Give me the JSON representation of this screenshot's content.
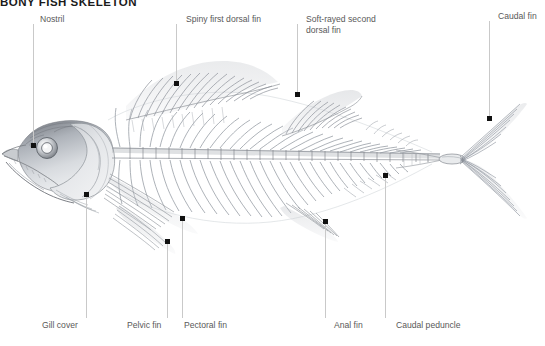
{
  "document": {
    "title": "BONY FISH SKELETON",
    "subject": "fish-skeleton-anatomical-diagram"
  },
  "palette": {
    "background": "#ffffff",
    "leader_line": "#c9c9c9",
    "leader_dot": "#111111",
    "label_text": "#595959",
    "title_text": "#1b1b1b",
    "ink_dark": "#5b5f66",
    "ink_mid": "#9aa0a8",
    "ink_light": "#c8ccd2"
  },
  "illustration": {
    "name": "tuna-skeleton-pencil-drawing",
    "description": "Grayscale pencil rendering of a bony fish (tuna) skeleton in left lateral view, showing skull, gill cover, vertebral column, ribs, dorsal fins, pectoral fin, pelvic fin, anal fin, caudal peduncle and forked caudal fin."
  },
  "callouts": [
    {
      "id": "nostril",
      "label": "Nostril",
      "side": "top",
      "label_x": 40,
      "label_y": 14,
      "line_x": 33,
      "line_top": 24,
      "line_bottom": 145,
      "dot_x": 33,
      "dot_y": 145
    },
    {
      "id": "spiny-first-dorsal-fin",
      "label": "Spiny first dorsal fin",
      "side": "top",
      "label_x": 186,
      "label_y": 14,
      "line_x": 176,
      "line_top": 24,
      "line_bottom": 83,
      "dot_x": 176,
      "dot_y": 83
    },
    {
      "id": "soft-rayed-second-dorsal-fin",
      "label": "Soft-rayed second\ndorsal fin",
      "side": "top",
      "label_x": 306,
      "label_y": 14,
      "line_x": 297,
      "line_top": 24,
      "line_bottom": 94,
      "dot_x": 297,
      "dot_y": 94
    },
    {
      "id": "caudal-fin",
      "label": "Caudal fin",
      "side": "top",
      "label_x": 498,
      "label_y": 11,
      "line_x": 489,
      "line_top": 21,
      "line_bottom": 118,
      "dot_x": 489,
      "dot_y": 118
    },
    {
      "id": "gill-cover",
      "label": "Gill cover",
      "side": "bottom",
      "label_x": 42,
      "label_y": 320,
      "line_x": 86,
      "line_top": 194,
      "line_bottom": 318,
      "dot_x": 86,
      "dot_y": 194
    },
    {
      "id": "pelvic-fin",
      "label": "Pelvic fin",
      "side": "bottom",
      "label_x": 127,
      "label_y": 320,
      "line_x": 167,
      "line_top": 241,
      "line_bottom": 318,
      "dot_x": 167,
      "dot_y": 241
    },
    {
      "id": "pectoral-fin",
      "label": "Pectoral fin",
      "side": "bottom",
      "label_x": 184,
      "label_y": 320,
      "line_x": 182,
      "line_top": 218,
      "line_bottom": 318,
      "dot_x": 182,
      "dot_y": 218
    },
    {
      "id": "anal-fin",
      "label": "Anal fin",
      "side": "bottom",
      "label_x": 334,
      "label_y": 320,
      "line_x": 325,
      "line_top": 221,
      "line_bottom": 318,
      "dot_x": 325,
      "dot_y": 221
    },
    {
      "id": "caudal-peduncle",
      "label": "Caudal peduncle",
      "side": "bottom",
      "label_x": 396,
      "label_y": 320,
      "line_x": 385,
      "line_top": 175,
      "line_bottom": 318,
      "dot_x": 385,
      "dot_y": 175
    }
  ]
}
